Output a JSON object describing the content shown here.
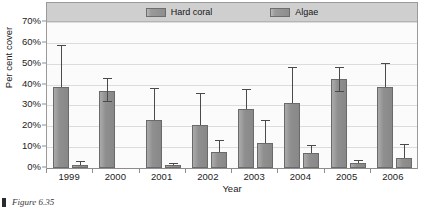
{
  "figure": {
    "caption_marker": "square-bullet",
    "caption_text": "Figure 6.35"
  },
  "legend": {
    "position": "top-center",
    "entries": [
      {
        "label": "Hard coral",
        "swatch": "#8f8f8f",
        "icon": "legend-swatch-icon"
      },
      {
        "label": "Algae",
        "swatch": "#8f8f8f",
        "icon": "legend-swatch-icon"
      }
    ]
  },
  "axes": {
    "y_title": "Per cent cover",
    "x_title": "Year",
    "y_ticks": [
      "0%",
      "10%",
      "20%",
      "30%",
      "40%",
      "50%",
      "60%",
      "70%"
    ],
    "x_ticks": [
      "1999",
      "2000",
      "2001",
      "2002",
      "2003",
      "2004",
      "2005",
      "2006"
    ]
  },
  "colors": {
    "bar_fill": "#8f8f8f",
    "bar_stroke": "#6a6a6a",
    "legend_band": "#cfcfcf",
    "plot_background": "#fbfbfb",
    "gridline": "#dcdcdc",
    "error_bar": "#4a4a4a"
  },
  "chart_data": {
    "type": "bar",
    "title": "",
    "subtitle": "",
    "xlabel": "Year",
    "ylabel": "Per cent cover",
    "ylim": [
      0,
      70
    ],
    "yticks": [
      0,
      10,
      20,
      30,
      40,
      50,
      60,
      70
    ],
    "ytick_labels": [
      "0%",
      "10%",
      "20%",
      "30%",
      "40%",
      "50%",
      "60%",
      "70%"
    ],
    "grid": true,
    "legend_position": "top-center",
    "categories": [
      "1999",
      "2000",
      "2001",
      "2002",
      "2003",
      "2004",
      "2005",
      "2006"
    ],
    "series": [
      {
        "name": "Hard coral",
        "values": [
          39,
          37,
          23,
          20.5,
          28.5,
          31,
          42.5,
          39
        ],
        "error_upper": [
          59,
          43,
          38.5,
          36,
          38,
          48.5,
          48.5,
          50.5
        ],
        "error_lower": [
          39,
          32,
          23,
          20.5,
          28.5,
          31,
          37,
          39
        ]
      },
      {
        "name": "Algae",
        "values": [
          1.5,
          null,
          1.5,
          7.5,
          12,
          7,
          2.5,
          5
        ],
        "error_upper": [
          3.5,
          null,
          2.5,
          13.5,
          23,
          11,
          4,
          11.5
        ],
        "error_lower": [
          1.5,
          null,
          1.5,
          7.5,
          12,
          7,
          2.5,
          5
        ]
      }
    ]
  }
}
